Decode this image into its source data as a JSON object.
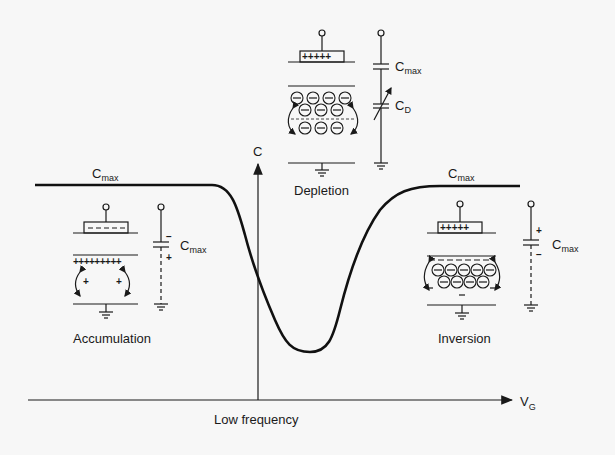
{
  "figure": {
    "x_axis_label": "V",
    "x_axis_subscript": "G",
    "y_axis_label": "C",
    "caption": "Low frequency",
    "line_color": "#111111",
    "background": "#f7f7f7"
  },
  "curve_labels": {
    "left_plateau": {
      "main": "C",
      "sub": "max"
    },
    "right_plateau": {
      "main": "C",
      "sub": "max"
    }
  },
  "regions": {
    "accumulation": {
      "label": "Accumulation",
      "gate_charge": "- - - -",
      "surface_charge": "+++++++++",
      "bulk_charge": [
        "+",
        "+"
      ],
      "circuit_capacitor": {
        "main": "C",
        "sub": "max",
        "top_sign": "−",
        "bottom_sign": "+"
      }
    },
    "depletion": {
      "label": "Depletion",
      "gate_charge": "+++++",
      "ions": "⊖",
      "circuit_capacitors": [
        {
          "main": "C",
          "sub": "max"
        },
        {
          "main": "C",
          "sub": "D",
          "variable": true
        }
      ]
    },
    "inversion": {
      "label": "Inversion",
      "gate_charge": "+++++",
      "ions": "⊖",
      "inversion_layer_charge": "− − − − −",
      "circuit_capacitor": {
        "main": "C",
        "sub": "max",
        "top_sign": "+",
        "bottom_sign": "−"
      }
    }
  }
}
